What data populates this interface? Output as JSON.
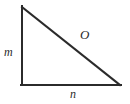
{
  "figure": {
    "kind": "right-triangle-diagram",
    "background_color": "#ffffff",
    "stroke_color": "#2b2b2b",
    "stroke_width": 2,
    "width": 130,
    "height": 104,
    "vertices": {
      "apex": [
        22,
        7
      ],
      "right_angle": [
        22,
        85
      ],
      "base_right": [
        120,
        85
      ]
    },
    "labels": {
      "vertical_leg": "m",
      "horizontal_leg": "n",
      "hypotenuse": "O"
    }
  }
}
